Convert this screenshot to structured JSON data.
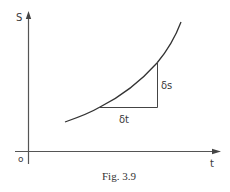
{
  "figure": {
    "caption": "Fig. 3.9",
    "axes": {
      "y_label": "S",
      "x_label": "t",
      "origin_label": "o"
    },
    "annotations": {
      "delta_s": "δs",
      "delta_t": "δt"
    },
    "curve": {
      "description": "increasing, concave-up curve of s against t",
      "points_px": [
        [
          65,
          122
        ],
        [
          100,
          107
        ],
        [
          130,
          88
        ],
        [
          157,
          63
        ],
        [
          181,
          22
        ]
      ]
    },
    "triangle": {
      "description": "right triangle showing small increments δt (horizontal) and δs (vertical) along the curve"
    },
    "colors": {
      "line": "#444444",
      "text": "#333333",
      "background": "#ffffff"
    }
  }
}
